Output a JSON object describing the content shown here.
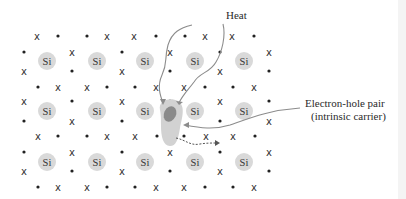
{
  "diagram": {
    "labels": {
      "heat": "Heat",
      "pair_line1": "Electron-hole pair",
      "pair_line2": "(intrinsic carrier)"
    },
    "atom_label": "Si",
    "colors": {
      "atom_fill": "#d9d9d9",
      "hole_fill": "#d0d0d0",
      "electron_fill": "#8a8a8a",
      "line": "#808080",
      "text": "#2a2a2a"
    },
    "atoms": [
      [
        47,
        61
      ],
      [
        97,
        61
      ],
      [
        145,
        61
      ],
      [
        195,
        61
      ],
      [
        244,
        61
      ],
      [
        47,
        111
      ],
      [
        97,
        111
      ],
      [
        145,
        111
      ],
      [
        195,
        111
      ],
      [
        244,
        111
      ],
      [
        47,
        162
      ],
      [
        97,
        162
      ],
      [
        145,
        162
      ],
      [
        195,
        162
      ],
      [
        244,
        162
      ]
    ],
    "horizontal_rows": [
      {
        "y": 36,
        "items": [
          [
            37,
            "x"
          ],
          [
            58,
            "d"
          ],
          [
            87,
            "d"
          ],
          [
            107,
            "x"
          ],
          [
            134,
            "x"
          ],
          [
            156,
            "d"
          ],
          [
            185,
            "d"
          ],
          [
            205,
            "x"
          ],
          [
            232,
            "x"
          ],
          [
            254,
            "d"
          ]
        ]
      },
      {
        "y": 87,
        "items": [
          [
            38,
            "d"
          ],
          [
            58,
            "x"
          ],
          [
            87,
            "x"
          ],
          [
            107,
            "d"
          ],
          [
            135,
            "d"
          ],
          [
            156,
            "x"
          ],
          [
            184,
            "x"
          ],
          [
            205,
            "d"
          ],
          [
            233,
            "d"
          ],
          [
            254,
            "x"
          ]
        ]
      },
      {
        "y": 136,
        "items": [
          [
            38,
            "x"
          ],
          [
            58,
            "d"
          ],
          [
            87,
            "d"
          ],
          [
            107,
            "x"
          ],
          [
            135,
            "x"
          ],
          [
            157,
            "d"
          ],
          [
            170,
            "x"
          ],
          [
            184,
            "d"
          ],
          [
            206,
            "x"
          ],
          [
            233,
            "x"
          ],
          [
            255,
            "d"
          ]
        ]
      },
      {
        "y": 187,
        "items": [
          [
            38,
            "d"
          ],
          [
            58,
            "x"
          ],
          [
            87,
            "x"
          ],
          [
            107,
            "d"
          ],
          [
            135,
            "d"
          ],
          [
            156,
            "x"
          ],
          [
            184,
            "x"
          ],
          [
            205,
            "d"
          ],
          [
            233,
            "d"
          ],
          [
            254,
            "x"
          ]
        ]
      }
    ],
    "vertical_rows": [
      {
        "y": 52,
        "items": [
          [
            24,
            "d"
          ],
          [
            72,
            "x"
          ],
          [
            122,
            "d"
          ],
          [
            170,
            "x"
          ],
          [
            220,
            "d"
          ],
          [
            269,
            "x"
          ]
        ]
      },
      {
        "y": 71,
        "items": [
          [
            24,
            "x"
          ],
          [
            72,
            "d"
          ],
          [
            122,
            "x"
          ],
          [
            170,
            "d"
          ],
          [
            220,
            "x"
          ],
          [
            269,
            "d"
          ]
        ]
      },
      {
        "y": 101,
        "items": [
          [
            24,
            "x"
          ],
          [
            72,
            "d"
          ],
          [
            122,
            "x"
          ],
          [
            170,
            "d"
          ],
          [
            220,
            "x"
          ],
          [
            269,
            "d"
          ]
        ]
      },
      {
        "y": 121,
        "items": [
          [
            24,
            "d"
          ],
          [
            72,
            "x"
          ],
          [
            122,
            "d"
          ],
          [
            220,
            "d"
          ],
          [
            269,
            "x"
          ]
        ]
      },
      {
        "y": 152,
        "items": [
          [
            24,
            "d"
          ],
          [
            72,
            "x"
          ],
          [
            122,
            "d"
          ],
          [
            170,
            "x"
          ],
          [
            220,
            "d"
          ],
          [
            269,
            "x"
          ]
        ]
      },
      {
        "y": 171,
        "items": [
          [
            24,
            "x"
          ],
          [
            72,
            "d"
          ],
          [
            122,
            "x"
          ],
          [
            170,
            "d"
          ],
          [
            220,
            "x"
          ],
          [
            269,
            "d"
          ]
        ]
      }
    ]
  }
}
